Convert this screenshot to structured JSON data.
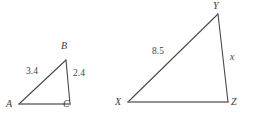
{
  "figure": {
    "background_color": "#ffffff",
    "stroke_color": "#4a4a4a",
    "baseline_color": "#6e6e6e",
    "text_color": "#3b3b3b"
  },
  "triangle_small": {
    "name": "triangle-abc",
    "vertices": {
      "A": {
        "label": "A",
        "x": 19,
        "y": 104
      },
      "B": {
        "label": "B",
        "x": 66,
        "y": 60
      },
      "C": {
        "label": "C",
        "x": 70,
        "y": 104
      }
    },
    "vertex_label_positions": {
      "A": {
        "x": 6,
        "y": 99
      },
      "B": {
        "x": 61,
        "y": 41
      },
      "C": {
        "x": 63,
        "y": 99
      }
    },
    "sides": [
      {
        "name": "side-ab",
        "label": "3.4",
        "between": "A-B",
        "x": 26,
        "y": 67
      },
      {
        "name": "side-bc",
        "label": "2.4",
        "between": "B-C",
        "x": 73,
        "y": 69
      }
    ]
  },
  "triangle_large": {
    "name": "triangle-xyz",
    "vertices": {
      "X": {
        "label": "X",
        "x": 128,
        "y": 102
      },
      "Y": {
        "label": "Y",
        "x": 218,
        "y": 14
      },
      "Z": {
        "label": "Z",
        "x": 228,
        "y": 102
      }
    },
    "vertex_label_positions": {
      "X": {
        "x": 115,
        "y": 97
      },
      "Y": {
        "x": 213,
        "y": 1
      },
      "Z": {
        "x": 231,
        "y": 97
      }
    },
    "sides": [
      {
        "name": "side-xy",
        "label": "8.5",
        "between": "X-Y",
        "x": 152,
        "y": 47
      },
      {
        "name": "side-yz",
        "label": "x",
        "between": "Y-Z",
        "x": 230,
        "y": 53
      }
    ]
  }
}
